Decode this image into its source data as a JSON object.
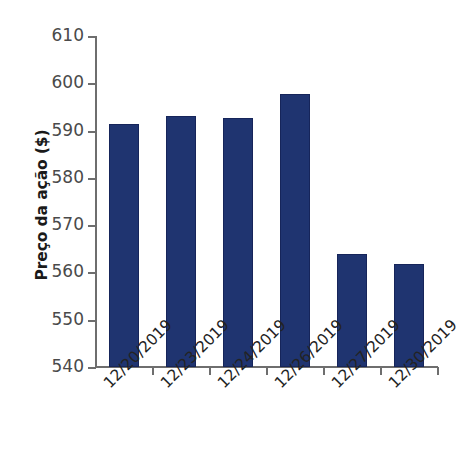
{
  "chart_data": {
    "type": "bar",
    "title": "",
    "subtitle": "",
    "xlabel": "",
    "ylabel": "Preço da ação ($)",
    "categories": [
      "12/20/2019",
      "12/23/2019",
      "12/24/2019",
      "12/26/2019",
      "12/27/2019",
      "12/30/2019"
    ],
    "values": [
      591.3,
      593.0,
      592.6,
      597.7,
      563.8,
      561.7
    ],
    "ylim": [
      540,
      610
    ],
    "ytick_values": [
      540,
      550,
      560,
      570,
      580,
      590,
      600,
      610
    ],
    "ytick_labels": [
      "540",
      "550",
      "560",
      "570",
      "580",
      "590",
      "600",
      "610"
    ],
    "grid": false,
    "legend": false,
    "legend_position": "none",
    "bar_color": "#1f3470",
    "bar_edge_color": "#16255a",
    "axis_color": "#6e6e6e",
    "background_color": "#ffffff",
    "xtick_label_rotation": -45
  }
}
